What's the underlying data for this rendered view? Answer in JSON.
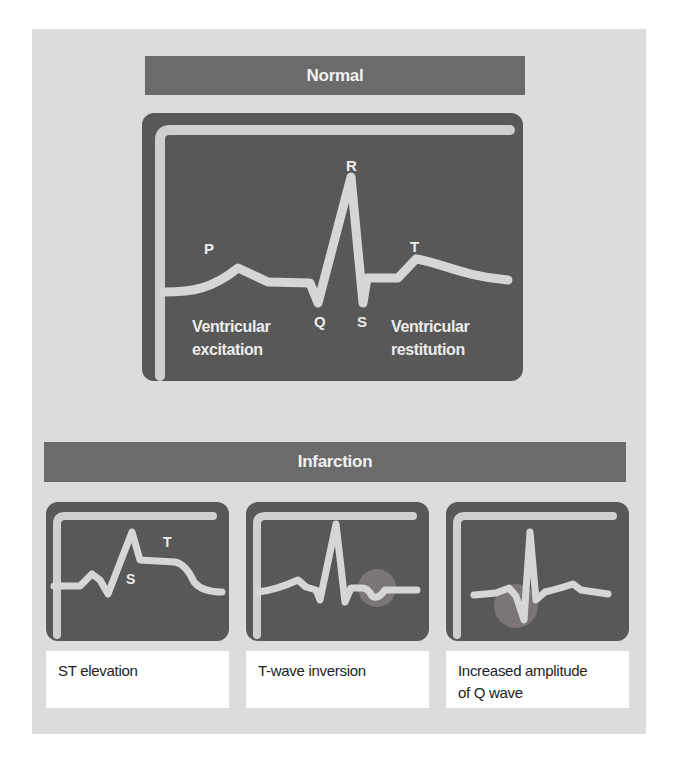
{
  "colors": {
    "page_bg": "#ffffff",
    "outer_panel": "#dcdcdc",
    "header_bar": "#6b6b6b",
    "dark_panel": "#585858",
    "trace": "#d6d6d6",
    "axis": "#cfcfcf",
    "highlight_circle": "#7b7575",
    "label_text": "#ececec",
    "caption_bg": "#ffffff"
  },
  "normal": {
    "title": "Normal",
    "labels": {
      "p": "P",
      "q": "Q",
      "r": "R",
      "s": "S",
      "t": "T"
    },
    "excitation_line1": "Ventricular",
    "excitation_line2": "excitation",
    "restitution_line1": "Ventricular",
    "restitution_line2": "restitution"
  },
  "infarction": {
    "title": "Infarction",
    "panels": [
      {
        "caption": "ST elevation",
        "labels": {
          "s": "S",
          "t": "T"
        }
      },
      {
        "caption": "T-wave inversion"
      },
      {
        "caption_line1": "Increased amplitude",
        "caption_line2": "of Q wave"
      }
    ]
  }
}
